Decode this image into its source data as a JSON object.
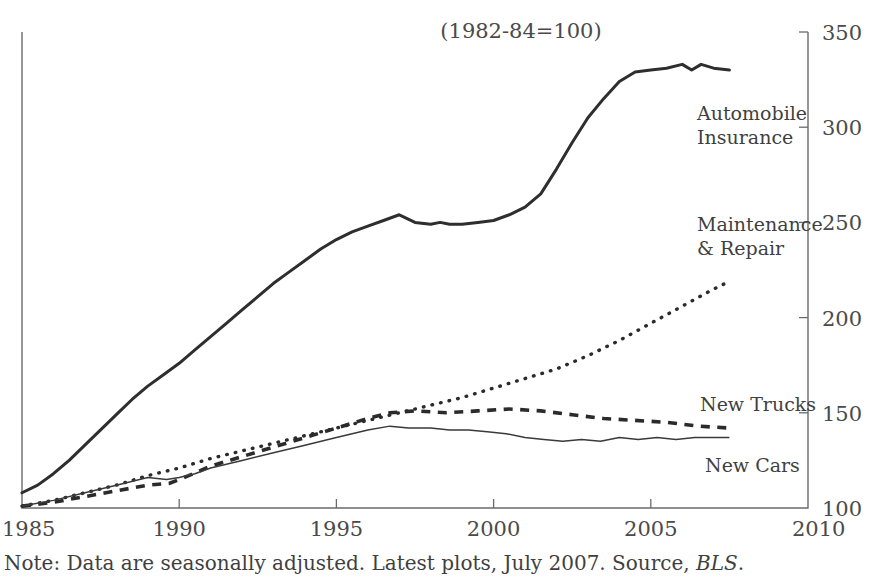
{
  "subtitle": "(1982-84=100)",
  "note": {
    "prefix": "Note: Data are seasonally adjusted. Latest plots, July 2007. Source, ",
    "source": "BLS",
    "suffix": "."
  },
  "axes": {
    "y_ticks": [
      "100",
      "150",
      "200",
      "250",
      "300",
      "350"
    ],
    "x_ticks": [
      "1985",
      "1990",
      "1995",
      "2000",
      "2005",
      "2010"
    ]
  },
  "series_labels": {
    "auto_insurance_line1": "Automobile",
    "auto_insurance_line2": "Insurance",
    "maintenance_line1": "Maintenance",
    "maintenance_line2": "& Repair",
    "new_trucks": "New Trucks",
    "new_cars": "New Cars"
  },
  "chart_data": {
    "type": "line",
    "title": "",
    "subtitle": "(1982-84=100)",
    "xlabel": "",
    "ylabel": "",
    "xlim": [
      1985,
      2010
    ],
    "ylim": [
      100,
      350
    ],
    "ytick_values": [
      100,
      150,
      200,
      250,
      300,
      350
    ],
    "xtick_values": [
      1985,
      1990,
      1995,
      2000,
      2005,
      2010
    ],
    "grid": false,
    "legend": "inline-right-labels",
    "series": [
      {
        "name": "Automobile Insurance",
        "style": "solid-thick",
        "x": [
          1985.0,
          1985.5,
          1986.0,
          1986.5,
          1987.0,
          1987.5,
          1988.0,
          1988.5,
          1989.0,
          1989.5,
          1990.0,
          1990.5,
          1991.0,
          1991.5,
          1992.0,
          1992.5,
          1993.0,
          1993.5,
          1994.0,
          1994.5,
          1995.0,
          1995.5,
          1996.0,
          1996.5,
          1997.0,
          1997.5,
          1998.0,
          1998.3,
          1998.6,
          1999.0,
          1999.5,
          2000.0,
          2000.5,
          2001.0,
          2001.5,
          2002.0,
          2002.5,
          2003.0,
          2003.5,
          2004.0,
          2004.5,
          2005.0,
          2005.5,
          2006.0,
          2006.3,
          2006.6,
          2007.0,
          2007.5
        ],
        "y": [
          108,
          112,
          118,
          125,
          133,
          141,
          149,
          157,
          164,
          170,
          176,
          183,
          190,
          197,
          204,
          211,
          218,
          224,
          230,
          236,
          241,
          245,
          248,
          251,
          254,
          250,
          249,
          250,
          249,
          249,
          250,
          251,
          254,
          258,
          265,
          278,
          292,
          305,
          315,
          324,
          329,
          330,
          331,
          333,
          330,
          333,
          331,
          330
        ]
      },
      {
        "name": "Maintenance & Repair",
        "style": "dotted",
        "x": [
          1985.0,
          1986.0,
          1987.0,
          1988.0,
          1989.0,
          1990.0,
          1991.0,
          1992.0,
          1993.0,
          1994.0,
          1995.0,
          1996.0,
          1997.0,
          1998.0,
          1999.0,
          2000.0,
          2001.0,
          2002.0,
          2003.0,
          2004.0,
          2005.0,
          2006.0,
          2007.0,
          2007.5
        ],
        "y": [
          101,
          104,
          108,
          112,
          117,
          121,
          126,
          130,
          134,
          138,
          142,
          146,
          150,
          154,
          158,
          163,
          168,
          173,
          180,
          188,
          197,
          206,
          215,
          219
        ]
      },
      {
        "name": "New Trucks",
        "style": "dashed",
        "x": [
          1985.0,
          1986.0,
          1987.0,
          1988.0,
          1989.0,
          1989.7,
          1990.3,
          1991.0,
          1992.0,
          1993.0,
          1994.0,
          1995.0,
          1996.0,
          1996.7,
          1997.5,
          1998.5,
          1999.5,
          2000.5,
          2001.5,
          2002.5,
          2003.5,
          2004.5,
          2005.5,
          2006.5,
          2007.5
        ],
        "y": [
          101,
          103,
          106,
          109,
          112,
          113,
          117,
          122,
          127,
          132,
          137,
          142,
          147,
          150,
          151,
          150,
          151,
          152,
          151,
          149,
          147,
          146,
          145,
          143,
          142
        ]
      },
      {
        "name": "New Cars",
        "style": "solid-thin",
        "x": [
          1985.0,
          1986.0,
          1987.0,
          1988.0,
          1989.0,
          1989.6,
          1990.0,
          1990.5,
          1991.0,
          1992.0,
          1993.0,
          1994.0,
          1995.0,
          1996.0,
          1996.7,
          1997.3,
          1998.0,
          1998.6,
          1999.2,
          1999.8,
          2000.4,
          2001.0,
          2001.6,
          2002.2,
          2002.8,
          2003.4,
          2004.0,
          2004.6,
          2005.2,
          2005.8,
          2006.4,
          2007.0,
          2007.5
        ],
        "y": [
          101,
          104,
          108,
          112,
          116,
          115,
          116,
          118,
          121,
          125,
          129,
          133,
          137,
          141,
          143,
          142,
          142,
          141,
          141,
          140,
          139,
          137,
          136,
          135,
          136,
          135,
          137,
          136,
          137,
          136,
          137,
          137,
          137
        ]
      }
    ]
  }
}
